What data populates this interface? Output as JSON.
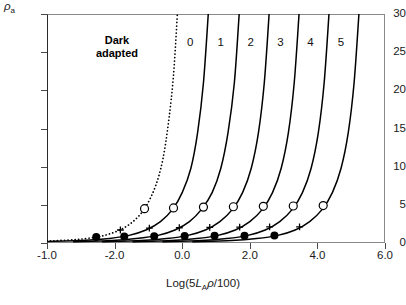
{
  "chart_data": {
    "type": "line",
    "title": "",
    "xlabel": "Log(5LAρ/100)",
    "ylabel": "ρa",
    "xlim": [
      -1.0,
      6.0
    ],
    "ylim": [
      0,
      30
    ],
    "grid": false,
    "legend_position": "inline-curve-labels",
    "xticks": [
      "-1.0",
      "-2.0",
      "0.0",
      "2.0",
      "4.0",
      "6.0"
    ],
    "xtick_values": [
      -1.0,
      0.4,
      1.8,
      3.2,
      4.6,
      6.0
    ],
    "yticks": [
      "0",
      "5",
      "10",
      "15",
      "20",
      "25",
      "30"
    ],
    "ytick_values": [
      0,
      5,
      10,
      15,
      20,
      25,
      30
    ],
    "annotations": [
      {
        "text": "Dark adapted",
        "x": 0.45,
        "y": 26.5,
        "style": "bold"
      }
    ],
    "series": [
      {
        "name": "Dark adapted",
        "label": "",
        "linestyle": "dotted",
        "x": [
          -1.0,
          -0.4,
          0.0,
          0.3,
          0.6,
          0.85,
          1.05,
          1.25,
          1.4,
          1.52,
          1.62,
          1.7
        ],
        "y": [
          0.25,
          0.45,
          0.75,
          1.2,
          2.0,
          3.2,
          4.8,
          7.5,
          11.0,
          16.0,
          22.0,
          30.0
        ],
        "markers": [
          {
            "type": "filled-circle",
            "x": 0.02,
            "y": 0.8
          },
          {
            "type": "cross",
            "x": 0.52,
            "y": 1.7
          },
          {
            "type": "open-circle",
            "x": 1.02,
            "y": 4.5
          }
        ]
      },
      {
        "name": "curve-0",
        "label": "0",
        "linestyle": "solid",
        "x": [
          -1.0,
          -0.2,
          0.3,
          0.7,
          1.05,
          1.35,
          1.6,
          1.8,
          1.98,
          2.12,
          2.24,
          2.34
        ],
        "y": [
          0.2,
          0.35,
          0.6,
          1.0,
          1.7,
          2.8,
          4.4,
          6.6,
          9.8,
          14.5,
          21.0,
          30.0
        ],
        "markers": [
          {
            "type": "filled-circle",
            "x": 0.6,
            "y": 0.85
          },
          {
            "type": "cross",
            "x": 1.12,
            "y": 1.95
          },
          {
            "type": "open-circle",
            "x": 1.62,
            "y": 4.6
          }
        ]
      },
      {
        "name": "curve-1",
        "label": "1",
        "linestyle": "solid",
        "x": [
          -0.45,
          0.35,
          0.85,
          1.3,
          1.65,
          1.95,
          2.2,
          2.42,
          2.6,
          2.75,
          2.88,
          2.98
        ],
        "y": [
          0.18,
          0.32,
          0.58,
          1.0,
          1.7,
          2.8,
          4.4,
          6.6,
          9.8,
          14.5,
          21.0,
          30.0
        ],
        "markers": [
          {
            "type": "filled-circle",
            "x": 1.22,
            "y": 0.9
          },
          {
            "type": "cross",
            "x": 1.74,
            "y": 2.0
          },
          {
            "type": "open-circle",
            "x": 2.24,
            "y": 4.7
          }
        ]
      },
      {
        "name": "curve-2",
        "label": "2",
        "linestyle": "solid",
        "x": [
          0.15,
          0.95,
          1.48,
          1.92,
          2.28,
          2.58,
          2.84,
          3.05,
          3.23,
          3.38,
          3.5,
          3.6
        ],
        "y": [
          0.18,
          0.32,
          0.58,
          1.0,
          1.7,
          2.8,
          4.4,
          6.6,
          9.8,
          14.5,
          21.0,
          30.0
        ],
        "markers": [
          {
            "type": "filled-circle",
            "x": 1.85,
            "y": 0.92
          },
          {
            "type": "cross",
            "x": 2.37,
            "y": 2.05
          },
          {
            "type": "open-circle",
            "x": 2.86,
            "y": 4.75
          }
        ]
      },
      {
        "name": "curve-3",
        "label": "3",
        "linestyle": "solid",
        "x": [
          0.78,
          1.58,
          2.1,
          2.54,
          2.9,
          3.2,
          3.46,
          3.67,
          3.85,
          4.0,
          4.12,
          4.22
        ],
        "y": [
          0.18,
          0.32,
          0.58,
          1.0,
          1.7,
          2.8,
          4.4,
          6.6,
          9.8,
          14.5,
          21.0,
          30.0
        ],
        "markers": [
          {
            "type": "filled-circle",
            "x": 2.47,
            "y": 0.94
          },
          {
            "type": "cross",
            "x": 2.99,
            "y": 2.08
          },
          {
            "type": "open-circle",
            "x": 3.48,
            "y": 4.8
          }
        ]
      },
      {
        "name": "curve-4",
        "label": "4",
        "linestyle": "solid",
        "x": [
          1.4,
          2.2,
          2.72,
          3.16,
          3.52,
          3.82,
          4.08,
          4.29,
          4.47,
          4.62,
          4.74,
          4.84
        ],
        "y": [
          0.18,
          0.32,
          0.58,
          1.0,
          1.7,
          2.8,
          4.4,
          6.6,
          9.8,
          14.5,
          21.0,
          30.0
        ],
        "markers": [
          {
            "type": "filled-circle",
            "x": 3.09,
            "y": 0.96
          },
          {
            "type": "cross",
            "x": 3.61,
            "y": 2.1
          },
          {
            "type": "open-circle",
            "x": 4.1,
            "y": 4.85
          }
        ]
      },
      {
        "name": "curve-5",
        "label": "5",
        "linestyle": "solid",
        "x": [
          2.02,
          2.82,
          3.34,
          3.78,
          4.14,
          4.44,
          4.7,
          4.91,
          5.09,
          5.24,
          5.36,
          5.46
        ],
        "y": [
          0.18,
          0.32,
          0.58,
          1.0,
          1.7,
          2.8,
          4.4,
          6.6,
          9.8,
          14.5,
          21.0,
          30.0
        ],
        "markers": [
          {
            "type": "filled-circle",
            "x": 3.71,
            "y": 0.98
          },
          {
            "type": "cross",
            "x": 4.23,
            "y": 2.12
          },
          {
            "type": "open-circle",
            "x": 4.72,
            "y": 4.9
          }
        ]
      }
    ],
    "curve_labels": [
      {
        "label": "0",
        "x": 1.9,
        "y": 26.2
      },
      {
        "label": "1",
        "x": 2.53,
        "y": 26.2
      },
      {
        "label": "2",
        "x": 3.15,
        "y": 26.2
      },
      {
        "label": "3",
        "x": 3.77,
        "y": 26.2
      },
      {
        "label": "4",
        "x": 4.39,
        "y": 26.2
      },
      {
        "label": "5",
        "x": 5.02,
        "y": 26.2
      }
    ],
    "marker_legend": [
      {
        "type": "filled-circle",
        "symbol": "●"
      },
      {
        "type": "cross",
        "symbol": "+"
      },
      {
        "type": "open-circle",
        "symbol": "○"
      }
    ],
    "colors": {
      "line": "#000000",
      "axis": "#4a4a4a",
      "text": "#1a1a1a"
    }
  }
}
